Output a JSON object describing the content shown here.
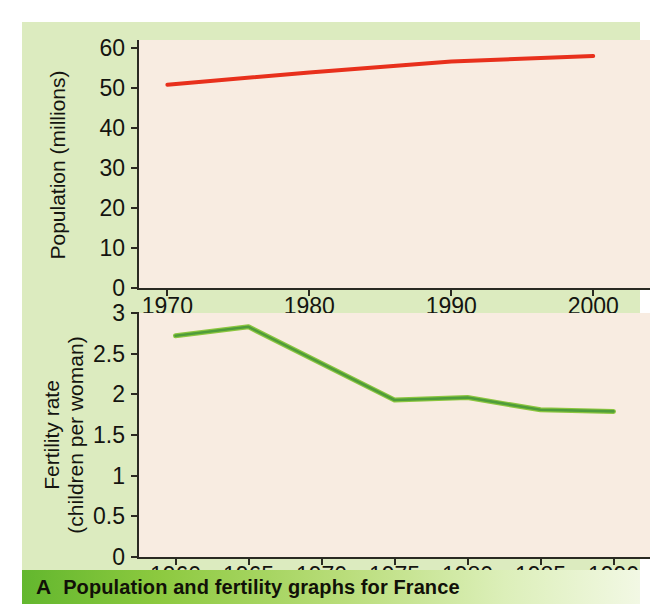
{
  "figure": {
    "caption_letter": "A",
    "caption_text": "Population and fertility graphs for France",
    "panel_color": "#dcebbf",
    "plot_background": "#f8ece1",
    "caption_bar_color_left": "#63b72e",
    "caption_bar_color_right": "#f2f8e4"
  },
  "chart_data": [
    {
      "type": "line",
      "id": "population",
      "title": "",
      "xlabel": "",
      "ylabel": "Population (millions)",
      "line_color": "#e8301c",
      "grid": false,
      "legend": "none",
      "xlim": [
        1968,
        2004
      ],
      "ylim": [
        0,
        62
      ],
      "x_ticks": [
        1970,
        1980,
        1990,
        2000
      ],
      "x_tick_labels": [
        "1970",
        "1980",
        "1990",
        "2000"
      ],
      "x_tick_sublabels": [
        "",
        "",
        "",
        "(predicted)"
      ],
      "y_ticks": [
        0,
        10,
        20,
        30,
        40,
        50,
        60
      ],
      "y_tick_labels": [
        "0",
        "10",
        "20",
        "30",
        "40",
        "50",
        "60"
      ],
      "x": [
        1970,
        1980,
        1990,
        2000
      ],
      "values": [
        50.8,
        53.9,
        56.6,
        58.0
      ]
    },
    {
      "type": "line",
      "id": "fertility",
      "title": "",
      "xlabel": "",
      "ylabel_line1": "Fertility rate",
      "ylabel_line2": "(children per woman)",
      "line_color": "#4f9c3a",
      "line_highlight_color": "#8cc63f",
      "grid": false,
      "legend": "none",
      "xlim": [
        1957.5,
        1992.5
      ],
      "ylim": [
        0,
        3
      ],
      "x_ticks": [
        1960,
        1965,
        1970,
        1975,
        1980,
        1985,
        1990
      ],
      "x_tick_labels": [
        "1960",
        "1965",
        "1970",
        "1975",
        "1980",
        "1985",
        "1990"
      ],
      "y_ticks": [
        0,
        0.5,
        1,
        1.5,
        2,
        2.5,
        3
      ],
      "y_tick_labels": [
        "0",
        "0.5",
        "1",
        "1.5",
        "2",
        "2.5",
        "3"
      ],
      "x": [
        1960,
        1965,
        1975,
        1980,
        1985,
        1990
      ],
      "values": [
        2.72,
        2.83,
        1.93,
        1.96,
        1.81,
        1.79
      ]
    }
  ]
}
